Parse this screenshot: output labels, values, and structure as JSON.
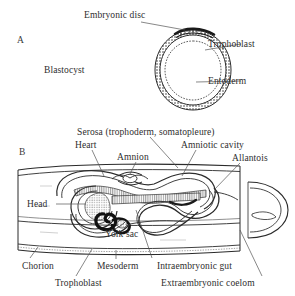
{
  "figure": {
    "type": "scientific-diagram",
    "background_color": "#ffffff",
    "ink_color": "#2b2b2b",
    "panels": [
      {
        "letter": "A",
        "title": "Blastocyst",
        "labels": [
          "Embryonic disc",
          "Trophoblast",
          "Blastocyst",
          "Entoderm"
        ]
      },
      {
        "letter": "B",
        "title": "Implanted embryo longitudinal section",
        "labels": [
          "Serosa (trophoderm, somatopleure)",
          "Heart",
          "Amnion",
          "Amniotic cavity",
          "Allantois",
          "Head",
          "Yolk sac",
          "Chorion",
          "Trophoblast",
          "Mesoderm",
          "Intraembryonic gut",
          "Extraembryonic coelom"
        ]
      }
    ]
  },
  "panel_a": {
    "letter": "A",
    "embryonic_disc": "Embryonic disc",
    "trophoblast": "Trophoblast",
    "blastocyst": "Blastocyst",
    "entoderm": "Entoderm"
  },
  "panel_b": {
    "letter": "B",
    "serosa": "Serosa (trophoderm, somatopleure)",
    "heart": "Heart",
    "amnion": "Amnion",
    "amniotic_cavity": "Amniotic cavity",
    "allantois": "Allantois",
    "head": "Head",
    "yolk_sac": "Yolk sac",
    "chorion": "Chorion",
    "trophoblast": "Trophoblast",
    "mesoderm": "Mesoderm",
    "intraembryonic_gut": "Intraembryonic gut",
    "extraembryonic_coelom": "Extraembryonic coelom"
  }
}
